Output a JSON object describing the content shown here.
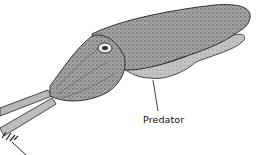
{
  "diagram": {
    "labels": [
      {
        "id": "predator",
        "text": "Predator"
      }
    ],
    "colors": {
      "body_fill": "#a9a9a9",
      "body_dark": "#5a5a5a",
      "outline": "#1a1a1a",
      "background": "#ffffff"
    }
  }
}
